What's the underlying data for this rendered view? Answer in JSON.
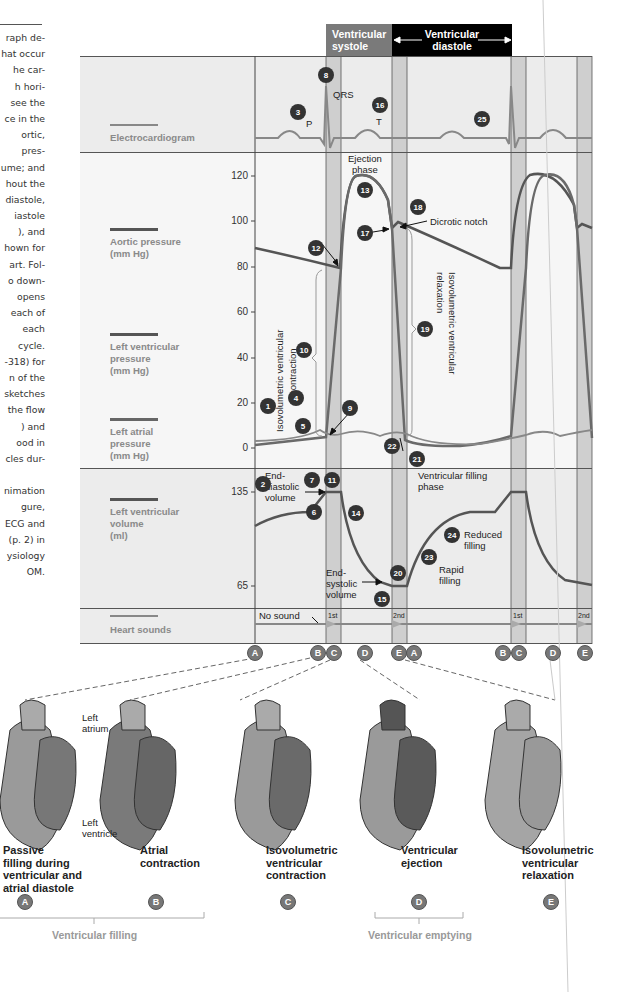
{
  "side_text": {
    "lines": [
      "raph de-",
      "hat occur",
      "he car-",
      "h hori-",
      "see the",
      "ce in the",
      "ortic,",
      "pres-",
      "ume; and",
      "hout the",
      "diastole,",
      "iastole",
      "), and",
      "hown for",
      "art. Fol-",
      "o down-",
      "opens",
      "each of",
      "each",
      "cycle.",
      "-318) for",
      "n of the",
      "sketches",
      "the flow",
      ") and",
      "ood in",
      "cles dur-",
      "",
      "nimation",
      "gure,",
      "ECG and",
      "(p. 2) in",
      "ysiology",
      "OM."
    ]
  },
  "phase_headers": {
    "systole": "Ventricular systole",
    "systole_l1": "Ventricular",
    "systole_l2": "systole",
    "diastole_l1": "Ventricular",
    "diastole_l2": "diastole",
    "systole_color": "#7a7a7a",
    "diastole_color": "#000000"
  },
  "legend": {
    "ecg": "Electrocardiogram",
    "aortic_l1": "Aortic pressure",
    "aortic_l2": "(mm Hg)",
    "lvp_l1": "Left ventricular",
    "lvp_l2": "pressure",
    "lvp_l3": "(mm Hg)",
    "lap_l1": "Left atrial",
    "lap_l2": "pressure",
    "lap_l3": "(mm Hg)",
    "lvv_l1": "Left ventricular",
    "lvv_l2": "volume",
    "lvv_l3": "(ml)",
    "sounds": "Heart sounds"
  },
  "chart_data": {
    "type": "line",
    "panels": [
      {
        "name": "Electrocardiogram",
        "waves": [
          "P",
          "QRS",
          "T",
          "P"
        ]
      },
      {
        "name": "Pressure (mm Hg)",
        "yticks": [
          0,
          20,
          40,
          60,
          80,
          100,
          120
        ],
        "ylim": [
          0,
          125
        ],
        "series": [
          {
            "name": "Aortic pressure",
            "points": [
              [
                0,
                88
              ],
              [
                0.27,
                80
              ],
              [
                0.35,
                118
              ],
              [
                0.45,
                96
              ],
              [
                0.48,
                99
              ],
              [
                0.85,
                79
              ],
              [
                0.95,
                118
              ],
              [
                1.0,
                96
              ]
            ]
          },
          {
            "name": "Left ventricular pressure",
            "points": [
              [
                0,
                3
              ],
              [
                0.2,
                7
              ],
              [
                0.27,
                8
              ],
              [
                0.31,
                80
              ],
              [
                0.35,
                118
              ],
              [
                0.45,
                96
              ],
              [
                0.48,
                8
              ],
              [
                0.52,
                2
              ],
              [
                0.85,
                7
              ],
              [
                0.95,
                118
              ],
              [
                1.0,
                8
              ]
            ]
          },
          {
            "name": "Left atrial pressure",
            "points": [
              [
                0,
                4
              ],
              [
                0.2,
                10
              ],
              [
                0.27,
                7
              ],
              [
                0.35,
                10
              ],
              [
                0.48,
                10
              ],
              [
                0.6,
                4
              ],
              [
                0.85,
                8
              ],
              [
                1.0,
                10
              ]
            ]
          }
        ]
      },
      {
        "name": "Left ventricular volume (ml)",
        "yticks": [
          65,
          135
        ],
        "series": [
          {
            "name": "Left ventricular volume",
            "points": [
              [
                0,
                115
              ],
              [
                0.2,
                122
              ],
              [
                0.27,
                135
              ],
              [
                0.31,
                135
              ],
              [
                0.45,
                65
              ],
              [
                0.49,
                65
              ],
              [
                0.6,
                100
              ],
              [
                0.8,
                122
              ],
              [
                0.85,
                135
              ],
              [
                0.89,
                135
              ],
              [
                1.0,
                65
              ]
            ]
          }
        ]
      },
      {
        "name": "Heart sounds",
        "labels": [
          "No sound",
          "1st",
          "2nd",
          "1st",
          "2nd"
        ]
      }
    ],
    "phase_letters": [
      "A",
      "B",
      "C",
      "D",
      "E",
      "A",
      "B",
      "C",
      "D",
      "E"
    ]
  },
  "annotations": {
    "qrs": "QRS",
    "p": "P",
    "t": "T",
    "ejection_l1": "Ejection",
    "ejection_l2": "phase",
    "dicrotic": "Dicrotic notch",
    "ivc_l1": "Isovolumetric ventricular",
    "ivc_l2": "contraction",
    "ivr_l1": "Isovolumetric ventricular",
    "ivr_l2": "relaxation",
    "edv_l1": "End-",
    "edv_l2": "diastolic",
    "edv_l3": "volume",
    "esv_l1": "End-",
    "esv_l2": "systolic",
    "esv_l3": "volume",
    "vfill_l1": "Ventricular filling",
    "vfill_l2": "phase",
    "reduced_l1": "Reduced",
    "reduced_l2": "filling",
    "rapid_l1": "Rapid",
    "rapid_l2": "filling",
    "no_sound": "No sound",
    "s1": "1st",
    "s2": "2nd"
  },
  "ticks": {
    "p120": "120",
    "p100": "100",
    "p80": "80",
    "p60": "60",
    "p40": "40",
    "p20": "20",
    "p0": "0",
    "v135": "135",
    "v65": "65"
  },
  "badges": [
    "1",
    "2",
    "3",
    "4",
    "5",
    "6",
    "7",
    "8",
    "9",
    "10",
    "11",
    "12",
    "13",
    "14",
    "15",
    "16",
    "17",
    "18",
    "19",
    "20",
    "21",
    "22",
    "23",
    "24",
    "25"
  ],
  "letters": {
    "a": "A",
    "b": "B",
    "c": "C",
    "d": "D",
    "e": "E"
  },
  "heart_labels": {
    "left_atrium_l1": "Left",
    "left_atrium_l2": "atrium",
    "left_ventricle_l1": "Left",
    "left_ventricle_l2": "ventricle"
  },
  "captions": {
    "a_l1": "Passive",
    "a_l2": "filling during",
    "a_l3": "ventricular and",
    "a_l4": "atrial diastole",
    "b_l1": "Atrial",
    "b_l2": "contraction",
    "c_l1": "Isovolumetric",
    "c_l2": "ventricular",
    "c_l3": "contraction",
    "d_l1": "Ventricular",
    "d_l2": "ejection",
    "e_l1": "Isovolumetric",
    "e_l2": "ventricular",
    "e_l3": "relaxation"
  },
  "groups": {
    "filling": "Ventricular filling",
    "emptying": "Ventricular emptying"
  }
}
